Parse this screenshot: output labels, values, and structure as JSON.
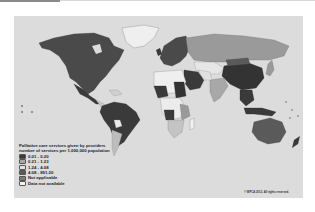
{
  "map": {
    "legend": {
      "title_line1": "Palliative care services given by providers",
      "title_line2": "number of services per 1,000,000 population",
      "items": [
        {
          "label": "0.01 - 0.20",
          "color": "#3a3a3a"
        },
        {
          "label": "0.21 - 1.23",
          "color": "#a8a8a8"
        },
        {
          "label": "1.24 - 4.08",
          "color": "#e2e2e2"
        },
        {
          "label": "4.08 - 891.20",
          "color": "#5a5a5a"
        },
        {
          "label": "Not applicable",
          "color": "#7a7a7a"
        },
        {
          "label": "Data not available",
          "color": "#f4f4f4"
        }
      ]
    },
    "copyright": "© WPCA 2012. All rights reserved.",
    "colors": {
      "ocean": "#dcdcdc",
      "dark": "#3a3a3a",
      "mid_dark": "#5a5a5a",
      "mid": "#8e8e8e",
      "light": "#bdbdbd",
      "very_light": "#ececec"
    }
  }
}
